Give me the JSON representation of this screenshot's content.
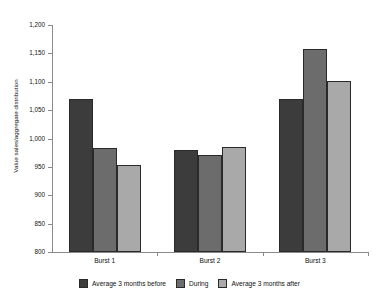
{
  "chart_data": {
    "type": "bar",
    "title": "",
    "xlabel": "",
    "ylabel": "Value sales/aggregate distribution",
    "ylim": [
      800,
      1200
    ],
    "ytick_step": 50,
    "yticks": [
      1200,
      1150,
      1100,
      1050,
      1000,
      950,
      900,
      850,
      800
    ],
    "ytick_labels": [
      "1,200",
      "1,150",
      "1,100",
      "1,050",
      "1,000",
      "950",
      "900",
      "850",
      "800"
    ],
    "categories": [
      "Burst 1",
      "Burst 2",
      "Burst 3"
    ],
    "grid": false,
    "legend_position": "bottom",
    "series": [
      {
        "name": "Average 3 months before",
        "color": "#3c3c3c",
        "values": [
          1070,
          980,
          1070
        ]
      },
      {
        "name": "During",
        "color": "#6c6c6c",
        "values": [
          984,
          971,
          1158
        ]
      },
      {
        "name": "Average 3 months after",
        "color": "#a9a9a9",
        "values": [
          954,
          985,
          1102
        ]
      }
    ]
  }
}
